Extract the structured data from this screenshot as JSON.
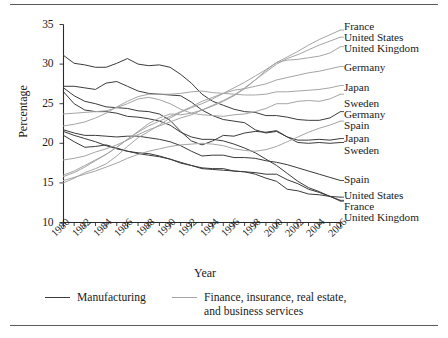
{
  "figure": {
    "axis_labels": {
      "y": "Percentage",
      "x": "Year"
    }
  },
  "legend": {
    "position": "bottom",
    "items": [
      {
        "label": "Manufacturing",
        "color": "#3b3b3b"
      },
      {
        "label": "Finance, insurance, real estate,\nand business services",
        "color": "#a5a5a5"
      }
    ]
  },
  "right_labels": [
    {
      "text": "France",
      "top": 21,
      "sector": "finance"
    },
    {
      "text": "United States",
      "top": 32,
      "sector": "finance"
    },
    {
      "text": "United Kingdom",
      "top": 43,
      "sector": "finance"
    },
    {
      "text": "Germany",
      "top": 62,
      "sector": "finance"
    },
    {
      "text": "Japan",
      "top": 82,
      "sector": "finance"
    },
    {
      "text": "Sweden",
      "top": 98,
      "sector": "finance"
    },
    {
      "text": "Germany",
      "top": 109,
      "sector": "manufacturing"
    },
    {
      "text": "Spain",
      "top": 120,
      "sector": "finance"
    },
    {
      "text": "Japan",
      "top": 133,
      "sector": "manufacturing"
    },
    {
      "text": "Sweden",
      "top": 145,
      "sector": "manufacturing"
    },
    {
      "text": "Spain",
      "top": 174,
      "sector": "manufacturing"
    },
    {
      "text": "United States",
      "top": 190,
      "sector": "manufacturing"
    },
    {
      "text": "France",
      "top": 201,
      "sector": "manufacturing"
    },
    {
      "text": "United Kingdom",
      "top": 212,
      "sector": "manufacturing"
    }
  ],
  "chart_data": {
    "type": "line",
    "title": "",
    "xlabel": "Year",
    "ylabel": "Percentage",
    "xlim": [
      1980,
      2006
    ],
    "ylim": [
      10,
      35
    ],
    "ytick_values": [
      10,
      15,
      20,
      25,
      30,
      35
    ],
    "xtick_values": [
      1980,
      1982,
      1984,
      1986,
      1988,
      1990,
      1992,
      1994,
      1996,
      1998,
      2000,
      2002,
      2004,
      2006
    ],
    "xtick_labels": [
      "1980",
      "1982",
      "1984",
      "1986",
      "1988",
      "1990",
      "1992",
      "1994",
      "1996",
      "1998",
      "2000",
      "2002",
      "2004",
      "2006"
    ],
    "xtick_minor_every": 1,
    "grid": false,
    "legend_position": "bottom",
    "x": [
      1980,
      1981,
      1982,
      1983,
      1984,
      1985,
      1986,
      1987,
      1988,
      1989,
      1990,
      1991,
      1992,
      1993,
      1994,
      1995,
      1996,
      1997,
      1998,
      1999,
      2000,
      2001,
      2002,
      2003,
      2004,
      2005,
      2006
    ],
    "series": [
      {
        "name": "Germany",
        "sector": "Manufacturing",
        "color": "#3b3b3b",
        "values": [
          31.1,
          30.1,
          29.9,
          29.6,
          29.6,
          30.1,
          30.7,
          30.0,
          29.8,
          29.9,
          29.6,
          28.7,
          27.6,
          26.2,
          25.3,
          24.8,
          24.3,
          24.0,
          23.9,
          23.5,
          23.5,
          23.3,
          23.0,
          22.9,
          22.9,
          23.2,
          24.0
        ]
      },
      {
        "name": "Japan",
        "sector": "Manufacturing",
        "color": "#3b3b3b",
        "values": [
          27.2,
          27.2,
          27.0,
          26.8,
          27.6,
          27.8,
          27.2,
          26.6,
          26.3,
          26.2,
          26.1,
          26.0,
          25.2,
          24.2,
          23.5,
          23.0,
          22.8,
          22.6,
          21.7,
          21.3,
          21.5,
          20.8,
          20.4,
          20.4,
          20.5,
          20.4,
          20.6
        ]
      },
      {
        "name": "Sweden",
        "sector": "Manufacturing",
        "color": "#3b3b3b",
        "values": [
          27.0,
          26.0,
          25.3,
          25.0,
          24.6,
          24.5,
          24.4,
          24.1,
          24.0,
          23.7,
          22.9,
          21.5,
          20.3,
          19.8,
          20.3,
          21.0,
          20.9,
          21.3,
          21.5,
          21.4,
          21.6,
          20.8,
          20.1,
          20.0,
          20.1,
          20.0,
          20.1
        ]
      },
      {
        "name": "Spain",
        "sector": "Manufacturing",
        "color": "#3b3b3b",
        "values": [
          21.7,
          21.3,
          21.0,
          21.0,
          20.9,
          20.8,
          20.9,
          20.9,
          20.7,
          20.5,
          20.2,
          19.7,
          19.0,
          18.4,
          18.5,
          18.5,
          18.2,
          18.2,
          18.1,
          17.8,
          17.6,
          17.3,
          16.9,
          16.5,
          16.1,
          15.7,
          15.3
        ]
      },
      {
        "name": "United States",
        "sector": "Manufacturing",
        "color": "#3b3b3b",
        "values": [
          21.0,
          20.2,
          19.5,
          19.6,
          19.8,
          19.4,
          19.0,
          18.8,
          18.7,
          18.4,
          18.0,
          17.5,
          17.2,
          16.9,
          16.8,
          16.8,
          16.5,
          16.4,
          16.1,
          15.6,
          15.2,
          14.2,
          14.0,
          13.6,
          13.5,
          13.3,
          13.2
        ]
      },
      {
        "name": "France",
        "sector": "Manufacturing",
        "color": "#3b3b3b",
        "values": [
          21.5,
          21.0,
          20.6,
          20.2,
          19.7,
          19.3,
          19.0,
          18.7,
          18.5,
          18.3,
          18.0,
          17.6,
          17.2,
          16.8,
          16.7,
          16.6,
          16.5,
          16.4,
          16.3,
          16.1,
          16.1,
          15.4,
          14.9,
          14.2,
          13.8,
          13.3,
          12.8
        ]
      },
      {
        "name": "United Kingdom",
        "sector": "Manufacturing",
        "color": "#3b3b3b",
        "values": [
          26.5,
          25.0,
          24.2,
          24.0,
          24.0,
          23.8,
          23.4,
          23.3,
          23.1,
          22.8,
          22.3,
          21.4,
          20.8,
          20.5,
          20.5,
          20.3,
          19.9,
          19.4,
          18.8,
          18.0,
          17.2,
          16.2,
          15.2,
          14.4,
          13.9,
          13.3,
          12.7
        ]
      },
      {
        "name": "France",
        "sector": "Finance, insurance, real estate, and business services",
        "color": "#a5a5a5",
        "values": [
          15.0,
          15.6,
          16.3,
          16.8,
          17.4,
          18.4,
          19.6,
          20.7,
          21.5,
          22.3,
          23.2,
          23.9,
          24.5,
          25.0,
          25.6,
          26.3,
          27.0,
          27.7,
          28.5,
          29.3,
          30.2,
          30.9,
          31.6,
          32.4,
          33.1,
          33.7,
          34.3
        ]
      },
      {
        "name": "United States",
        "sector": "Finance, insurance, real estate, and business services",
        "color": "#a5a5a5",
        "values": [
          17.9,
          18.1,
          18.4,
          18.9,
          19.3,
          19.8,
          20.4,
          21.1,
          21.7,
          22.2,
          22.7,
          23.2,
          23.6,
          24.2,
          24.8,
          25.4,
          26.1,
          27.0,
          28.0,
          29.0,
          30.0,
          30.7,
          31.2,
          31.8,
          32.4,
          32.9,
          33.4
        ]
      },
      {
        "name": "United Kingdom",
        "sector": "Finance, insurance, real estate, and business services",
        "color": "#a5a5a5",
        "values": [
          15.8,
          16.3,
          17.0,
          17.8,
          18.6,
          19.5,
          20.5,
          21.5,
          22.5,
          23.2,
          23.7,
          23.6,
          23.8,
          24.2,
          24.7,
          25.3,
          26.0,
          26.9,
          28.0,
          29.2,
          30.2,
          30.5,
          30.6,
          30.8,
          31.0,
          31.4,
          32.2
        ]
      },
      {
        "name": "Germany",
        "sector": "Finance, insurance, real estate, and business services",
        "color": "#a5a5a5",
        "values": [
          16.0,
          16.5,
          17.2,
          17.9,
          18.6,
          19.5,
          20.5,
          21.4,
          22.2,
          22.8,
          23.4,
          24.0,
          24.6,
          25.3,
          25.8,
          26.3,
          26.7,
          26.9,
          27.2,
          27.5,
          28.0,
          28.3,
          28.6,
          28.9,
          29.1,
          29.4,
          29.7
        ]
      },
      {
        "name": "Japan",
        "sector": "Finance, insurance, real estate, and business services",
        "color": "#a5a5a5",
        "values": [
          22.2,
          22.4,
          22.7,
          23.2,
          23.8,
          24.6,
          25.3,
          25.9,
          26.2,
          26.2,
          26.2,
          26.3,
          26.5,
          26.6,
          26.4,
          26.3,
          26.2,
          26.1,
          26.1,
          26.2,
          26.5,
          26.5,
          26.6,
          26.7,
          26.8,
          27.0,
          27.3
        ]
      },
      {
        "name": "Sweden",
        "sector": "Finance, insurance, real estate, and business services",
        "color": "#a5a5a5",
        "values": [
          23.7,
          23.8,
          23.9,
          24.0,
          24.1,
          24.5,
          25.0,
          25.6,
          25.8,
          25.5,
          25.0,
          24.3,
          23.8,
          23.6,
          23.5,
          23.4,
          23.6,
          23.7,
          24.0,
          24.4,
          25.0,
          25.0,
          25.3,
          25.4,
          25.3,
          25.6,
          26.2
        ]
      },
      {
        "name": "Spain",
        "sector": "Finance, insurance, real estate, and business services",
        "color": "#a5a5a5",
        "values": [
          15.3,
          15.7,
          16.1,
          16.5,
          17.0,
          17.5,
          18.1,
          18.6,
          19.0,
          19.3,
          19.6,
          19.8,
          19.9,
          20.0,
          19.9,
          19.7,
          19.3,
          19.1,
          19.0,
          19.2,
          19.6,
          20.2,
          20.8,
          21.4,
          21.9,
          22.3,
          22.8
        ]
      }
    ]
  }
}
